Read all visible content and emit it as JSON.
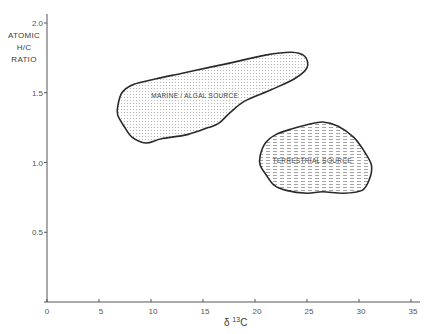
{
  "chart_data": {
    "type": "area",
    "title": "",
    "xlabel": {
      "prefix": "δ",
      "superscript": "13",
      "suffix": "C"
    },
    "ylabel_lines": [
      "ATOMIC",
      "H/C",
      "RATIO"
    ],
    "xlim": [
      0,
      36
    ],
    "ylim": [
      0,
      2.1
    ],
    "x_ticks": [
      0,
      5,
      10,
      15,
      20,
      25,
      30,
      35
    ],
    "x_tick_labels": [
      "0",
      "5",
      "10",
      "15",
      "20",
      "25",
      "30",
      "35"
    ],
    "y_ticks": [
      0.5,
      1.0,
      1.5,
      2.0
    ],
    "y_tick_labels": [
      "0.5",
      "1.0",
      "1.5",
      "2.0"
    ],
    "grid": false,
    "legend": "none",
    "series": [
      {
        "name": "MARINE / ALGAL SOURCE",
        "fill": "dotted",
        "label_position": [
          14.2,
          1.46
        ],
        "outline": [
          [
            6.8,
            1.4
          ],
          [
            7.2,
            1.5
          ],
          [
            8.3,
            1.56
          ],
          [
            10.5,
            1.6
          ],
          [
            13.0,
            1.64
          ],
          [
            15.5,
            1.68
          ],
          [
            18.0,
            1.72
          ],
          [
            21.0,
            1.77
          ],
          [
            23.5,
            1.79
          ],
          [
            24.8,
            1.76
          ],
          [
            25.0,
            1.68
          ],
          [
            23.8,
            1.6
          ],
          [
            21.5,
            1.52
          ],
          [
            19.0,
            1.44
          ],
          [
            17.5,
            1.35
          ],
          [
            16.5,
            1.28
          ],
          [
            15.5,
            1.25
          ],
          [
            13.5,
            1.2
          ],
          [
            11.0,
            1.17
          ],
          [
            9.5,
            1.14
          ],
          [
            8.2,
            1.18
          ],
          [
            7.4,
            1.26
          ],
          [
            6.8,
            1.34
          ]
        ]
      },
      {
        "name": "TERRESTRIAL SOURCE",
        "fill": "dashed",
        "label_position": [
          25.5,
          1.0
        ],
        "outline": [
          [
            20.5,
            1.05
          ],
          [
            21.0,
            1.14
          ],
          [
            22.0,
            1.2
          ],
          [
            23.5,
            1.24
          ],
          [
            25.0,
            1.27
          ],
          [
            26.5,
            1.29
          ],
          [
            28.0,
            1.26
          ],
          [
            29.5,
            1.18
          ],
          [
            30.5,
            1.08
          ],
          [
            31.2,
            0.98
          ],
          [
            31.0,
            0.88
          ],
          [
            30.3,
            0.8
          ],
          [
            28.5,
            0.78
          ],
          [
            26.5,
            0.79
          ],
          [
            25.0,
            0.78
          ],
          [
            23.0,
            0.8
          ],
          [
            21.8,
            0.84
          ],
          [
            21.0,
            0.92
          ],
          [
            20.5,
            0.98
          ]
        ]
      }
    ]
  }
}
